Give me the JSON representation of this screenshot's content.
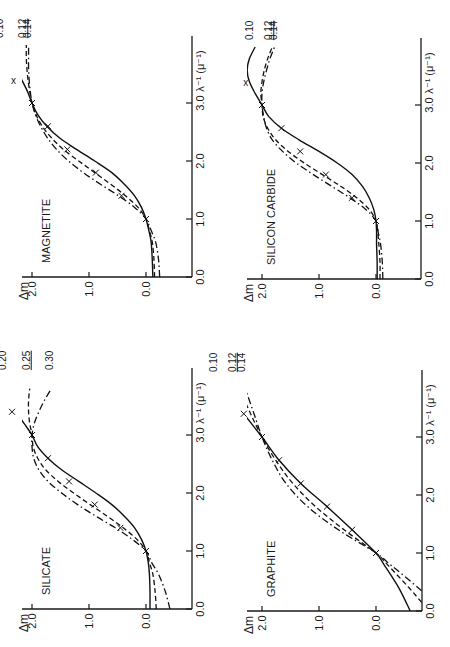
{
  "figure": {
    "orientation_note": "rotated 90 degrees counter-clockwise",
    "panels_layout": [
      "magnetite",
      "silicon_carbide",
      "silicate",
      "graphite"
    ]
  },
  "chart_data": [
    {
      "id": "magnetite",
      "type": "line",
      "title": "MAGNETITE",
      "xlabel": "λ⁻¹ (μ⁻¹)",
      "ylabel": "Δm",
      "xlim": [
        0.0,
        4.0
      ],
      "ylim": [
        -0.4,
        2.4
      ],
      "xticks": [
        "0.0",
        "1.0",
        "2.0",
        "3.0"
      ],
      "yticks": [
        "0.0",
        "1.0",
        "2.0"
      ],
      "legend": [
        "0.10",
        "0.12",
        "0.14"
      ],
      "series": [
        {
          "name": "0.10",
          "style": "solid",
          "x": [
            0.0,
            0.3,
            0.6,
            0.8,
            1.0,
            1.2,
            1.4,
            1.6,
            1.8,
            2.0,
            2.2,
            2.4,
            2.6,
            2.8,
            3.0,
            3.2,
            3.4,
            3.6,
            3.8,
            4.0
          ],
          "y": [
            -0.12,
            -0.11,
            -0.09,
            -0.05,
            0.0,
            0.08,
            0.2,
            0.38,
            0.6,
            0.9,
            1.22,
            1.52,
            1.74,
            1.9,
            2.0,
            2.08,
            2.18,
            2.28,
            2.38,
            2.48
          ]
        },
        {
          "name": "0.12",
          "style": "dash",
          "x": [
            0.0,
            0.3,
            0.6,
            0.8,
            1.0,
            1.2,
            1.4,
            1.6,
            1.8,
            2.0,
            2.2,
            2.4,
            2.6,
            2.8,
            3.0,
            3.2,
            3.4,
            3.6,
            3.8,
            4.0
          ],
          "y": [
            -0.15,
            -0.14,
            -0.11,
            -0.06,
            0.0,
            0.14,
            0.36,
            0.62,
            0.9,
            1.18,
            1.45,
            1.66,
            1.82,
            1.93,
            2.0,
            2.04,
            2.07,
            2.09,
            2.1,
            2.1
          ]
        },
        {
          "name": "0.14",
          "style": "dashdot",
          "x": [
            0.0,
            0.3,
            0.6,
            0.8,
            1.0,
            1.2,
            1.4,
            1.6,
            1.8,
            2.0,
            2.2,
            2.4,
            2.6,
            2.8,
            3.0,
            3.2,
            3.4,
            3.6,
            3.8,
            4.0
          ],
          "y": [
            -0.24,
            -0.22,
            -0.17,
            -0.09,
            0.0,
            0.2,
            0.48,
            0.8,
            1.1,
            1.36,
            1.57,
            1.73,
            1.85,
            1.94,
            2.0,
            2.03,
            2.05,
            2.06,
            2.06,
            2.06
          ]
        }
      ],
      "observations": [
        [
          1.0,
          0.0
        ],
        [
          1.4,
          0.43
        ],
        [
          1.8,
          0.88
        ],
        [
          2.2,
          1.38
        ],
        [
          2.6,
          1.72
        ],
        [
          3.0,
          2.0
        ],
        [
          3.4,
          2.3
        ]
      ]
    },
    {
      "id": "silicon_carbide",
      "type": "line",
      "title": "SILICON CARBIDE",
      "xlabel": "λ⁻¹ (μ⁻¹)",
      "ylabel": "Δm",
      "xlim": [
        0.0,
        4.0
      ],
      "ylim": [
        -0.4,
        2.4
      ],
      "xticks": [
        "0.0",
        "1.0",
        "2.0",
        "3.0"
      ],
      "yticks": [
        "0.0",
        "1.0",
        "2.0"
      ],
      "legend": [
        "0.10",
        "0.12",
        "0.14"
      ],
      "series": [
        {
          "name": "0.10",
          "style": "solid",
          "x": [
            0.0,
            0.3,
            0.6,
            0.8,
            1.0,
            1.2,
            1.4,
            1.6,
            1.8,
            2.0,
            2.2,
            2.4,
            2.6,
            2.8,
            3.0,
            3.2,
            3.4,
            3.6,
            3.8,
            4.0
          ],
          "y": [
            -0.02,
            -0.02,
            -0.01,
            -0.01,
            0.0,
            0.04,
            0.12,
            0.24,
            0.42,
            0.68,
            1.0,
            1.35,
            1.66,
            1.88,
            2.0,
            2.12,
            2.22,
            2.26,
            2.22,
            2.12
          ]
        },
        {
          "name": "0.12",
          "style": "dash",
          "x": [
            0.0,
            0.3,
            0.6,
            0.8,
            1.0,
            1.2,
            1.4,
            1.6,
            1.8,
            2.0,
            2.2,
            2.4,
            2.6,
            2.8,
            3.0,
            3.2,
            3.4,
            3.6,
            3.8,
            4.0
          ],
          "y": [
            -0.07,
            -0.07,
            -0.05,
            -0.03,
            0.0,
            0.12,
            0.34,
            0.62,
            0.94,
            1.26,
            1.54,
            1.76,
            1.9,
            1.98,
            2.0,
            2.02,
            2.0,
            1.96,
            1.9,
            1.82
          ]
        },
        {
          "name": "0.14",
          "style": "dashdot",
          "x": [
            0.0,
            0.3,
            0.6,
            0.8,
            1.0,
            1.2,
            1.4,
            1.6,
            1.8,
            2.0,
            2.2,
            2.4,
            2.6,
            2.8,
            3.0,
            3.2,
            3.4,
            3.6,
            3.8,
            4.0
          ],
          "y": [
            -0.12,
            -0.11,
            -0.08,
            -0.04,
            0.0,
            0.18,
            0.46,
            0.78,
            1.1,
            1.4,
            1.64,
            1.82,
            1.92,
            1.97,
            2.0,
            2.0,
            1.97,
            1.92,
            1.86,
            1.78
          ]
        }
      ],
      "observations": [
        [
          1.0,
          0.0
        ],
        [
          1.4,
          0.42
        ],
        [
          1.8,
          0.88
        ],
        [
          2.2,
          1.33
        ],
        [
          2.6,
          1.66
        ],
        [
          3.0,
          2.0
        ],
        [
          3.4,
          2.26
        ]
      ]
    },
    {
      "id": "silicate",
      "type": "line",
      "title": "SILICATE",
      "xlabel": "λ⁻¹ (μ⁻¹)",
      "ylabel": "Δm",
      "xlim": [
        0.0,
        4.0
      ],
      "ylim": [
        -0.4,
        2.4
      ],
      "xticks": [
        "0.0",
        "1.0",
        "2.0",
        "3.0"
      ],
      "yticks": [
        "0.0",
        "1.0",
        "2.0"
      ],
      "legend": [
        "0.20",
        "0.25",
        "0.30"
      ],
      "series": [
        {
          "name": "0.20",
          "style": "solid",
          "x": [
            0.0,
            0.3,
            0.6,
            0.8,
            1.0,
            1.2,
            1.4,
            1.6,
            1.8,
            2.0,
            2.2,
            2.4,
            2.6,
            2.8,
            3.0,
            3.2,
            3.4,
            3.6,
            3.8
          ],
          "y": [
            -0.07,
            -0.07,
            -0.06,
            -0.04,
            0.0,
            0.08,
            0.2,
            0.38,
            0.6,
            0.88,
            1.18,
            1.48,
            1.72,
            1.9,
            2.0,
            2.14,
            2.28,
            2.38,
            2.42
          ]
        },
        {
          "name": "0.25",
          "style": "dash",
          "x": [
            0.0,
            0.3,
            0.6,
            0.8,
            1.0,
            1.2,
            1.4,
            1.6,
            1.8,
            2.0,
            2.2,
            2.4,
            2.6,
            2.8,
            3.0,
            3.2,
            3.4,
            3.6,
            3.8
          ],
          "y": [
            -0.18,
            -0.16,
            -0.12,
            -0.06,
            0.0,
            0.16,
            0.4,
            0.68,
            0.98,
            1.27,
            1.54,
            1.76,
            1.9,
            1.98,
            2.0,
            2.04,
            2.06,
            2.06,
            2.04
          ]
        },
        {
          "name": "0.30",
          "style": "dashdot",
          "x": [
            0.0,
            0.3,
            0.6,
            0.8,
            1.0,
            1.2,
            1.4,
            1.6,
            1.8,
            2.0,
            2.2,
            2.4,
            2.6,
            2.8,
            3.0,
            3.2,
            3.4,
            3.6,
            3.8
          ],
          "y": [
            -0.42,
            -0.34,
            -0.22,
            -0.1,
            0.0,
            0.24,
            0.54,
            0.88,
            1.2,
            1.48,
            1.72,
            1.88,
            1.97,
            2.0,
            2.0,
            1.96,
            1.88,
            1.78,
            1.66
          ]
        }
      ],
      "observations": [
        [
          1.0,
          0.0
        ],
        [
          1.4,
          0.45
        ],
        [
          1.8,
          0.9
        ],
        [
          2.2,
          1.35
        ],
        [
          2.6,
          1.72
        ],
        [
          3.0,
          2.0
        ],
        [
          3.4,
          2.35
        ]
      ]
    },
    {
      "id": "graphite",
      "type": "line",
      "title": "GRAPHITE",
      "xlabel": "λ⁻¹ (μ⁻¹)",
      "ylabel": "Δm",
      "xlim": [
        0.0,
        4.0
      ],
      "ylim": [
        -0.8,
        2.4
      ],
      "xticks": [
        "0.0",
        "1.0",
        "2.0",
        "3.0"
      ],
      "yticks": [
        "0.0",
        "1.0",
        "2.0"
      ],
      "legend": [
        "0.10",
        "0.12",
        "0.14"
      ],
      "series": [
        {
          "name": "0.10",
          "style": "solid",
          "x": [
            0.0,
            0.4,
            0.8,
            1.0,
            1.4,
            1.8,
            2.2,
            2.6,
            3.0,
            3.4,
            3.8,
            4.0
          ],
          "y": [
            -0.6,
            -0.4,
            -0.14,
            0.0,
            0.42,
            0.86,
            1.32,
            1.7,
            2.0,
            2.32,
            2.62,
            2.75
          ]
        },
        {
          "name": "0.12",
          "style": "dash",
          "x": [
            0.15,
            0.4,
            0.8,
            1.0,
            1.4,
            1.8,
            2.2,
            2.6,
            3.0,
            3.4,
            3.8,
            4.0
          ],
          "y": [
            -0.8,
            -0.58,
            -0.2,
            0.0,
            0.56,
            1.06,
            1.46,
            1.76,
            2.0,
            2.2,
            2.38,
            2.46
          ]
        },
        {
          "name": "0.14",
          "style": "dashdot",
          "x": [
            0.35,
            0.6,
            0.8,
            1.0,
            1.4,
            1.8,
            2.2,
            2.6,
            3.0,
            3.4,
            3.8,
            4.0
          ],
          "y": [
            -0.8,
            -0.5,
            -0.25,
            0.0,
            0.66,
            1.2,
            1.58,
            1.82,
            2.0,
            2.14,
            2.28,
            2.34
          ]
        }
      ],
      "observations": [
        [
          1.0,
          0.0
        ],
        [
          1.4,
          0.42
        ],
        [
          1.8,
          0.86
        ],
        [
          2.2,
          1.32
        ],
        [
          2.6,
          1.7
        ],
        [
          3.0,
          2.0
        ],
        [
          3.4,
          2.32
        ]
      ]
    }
  ]
}
